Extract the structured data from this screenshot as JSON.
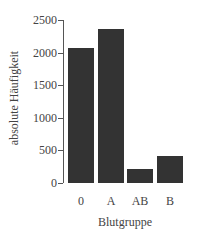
{
  "chart_data": {
    "type": "bar",
    "title": "",
    "xlabel": "Blutgruppe",
    "ylabel": "absolute Häufigkeit",
    "categories": [
      "0",
      "A",
      "AB",
      "B"
    ],
    "values": [
      2070,
      2360,
      215,
      415
    ],
    "ylim": [
      0,
      2500
    ],
    "yticks": [
      0,
      500,
      1000,
      1500,
      2000,
      2500
    ],
    "ytick_labels": [
      "0",
      "500",
      "1000",
      "1500",
      "2000",
      "2500"
    ],
    "grid": false,
    "legend": null,
    "bar_color": "#333333"
  }
}
